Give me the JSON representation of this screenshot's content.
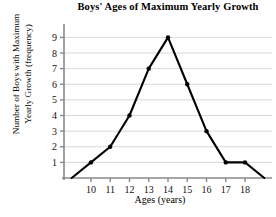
{
  "chart_data": {
    "type": "line",
    "title": "Boys' Ages of Maximum Yearly Growth",
    "xlabel": "Ages (years)",
    "ylabel": "Number of Boys with Maximum Yearly Growth (frequency)",
    "ylabel_line1": "Number of Boys with Maximum",
    "ylabel_line2": "Yearly Growth (frequency)",
    "x": [
      9,
      10,
      11,
      12,
      13,
      14,
      15,
      16,
      17,
      18,
      19
    ],
    "values": [
      0,
      1,
      2,
      4,
      7,
      9,
      6,
      3,
      1,
      1,
      0
    ],
    "x_tick_labels": [
      "10",
      "11",
      "12",
      "13",
      "14",
      "15",
      "16",
      "17",
      "18"
    ],
    "x_ticks": [
      10,
      11,
      12,
      13,
      14,
      15,
      16,
      17,
      18
    ],
    "y_tick_labels": [
      "1",
      "2",
      "3",
      "4",
      "5",
      "6",
      "7",
      "8",
      "9"
    ],
    "y_ticks": [
      1,
      2,
      3,
      4,
      5,
      6,
      7,
      8,
      9
    ],
    "xlim": [
      8.6,
      19.4
    ],
    "ylim": [
      0,
      9.6
    ],
    "grid": true,
    "grid_axis": "y",
    "legend": false,
    "marker": "filled-circle",
    "line_color": "#000000",
    "grid_color": "#d8d8d8",
    "axis_color": "#8a8a8a"
  }
}
